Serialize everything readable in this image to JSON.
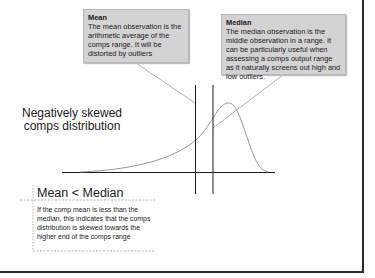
{
  "callouts": {
    "mean": {
      "title": "Mean",
      "body": "The mean observation is the arithmetic average of the comps range.  It will be distorted by outliers"
    },
    "median": {
      "title": "Median",
      "body": "The median observation is the middle observation in a range.  It can be particularly useful when assessing a comps output range as it naturally screens out high and low outliers."
    }
  },
  "chart_label": "Negatively skewed comps distribution",
  "note": {
    "title": "Mean < Median",
    "body": "If the comp mean is less than the median, this indicates that the comps distribution is skewed towards the higher end of the comps range"
  },
  "colors": {
    "callout_fill": "#d3d3d3",
    "line": "#1a1a1a",
    "curve": "#888888",
    "frame": "#2a2a2a"
  }
}
